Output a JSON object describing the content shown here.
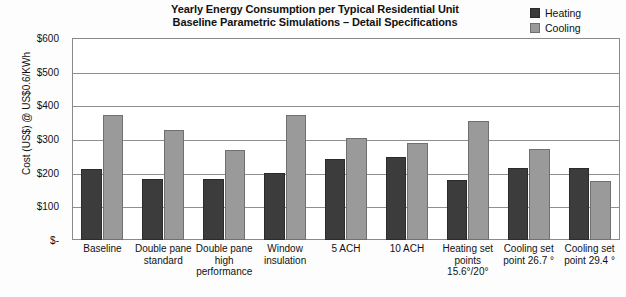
{
  "chart_data": {
    "type": "bar",
    "title": "Yearly Energy Consumption per Typical Residential Unit",
    "subtitle": "Baseline Parametric Simulations – Detail Specifications",
    "xlabel": "",
    "ylabel": "Cost (US$) @ US$0.6/KWh",
    "ylim": [
      0,
      600
    ],
    "ytick_values": [
      600,
      500,
      400,
      300,
      200,
      100,
      0
    ],
    "ytick_labels": [
      "$600",
      "$500",
      "$400",
      "$300",
      "$200",
      "$100",
      "$-"
    ],
    "grid": true,
    "legend_position": "top-right",
    "categories": [
      "Baseline",
      "Double pane standard",
      "Double pane high performance",
      "Window insulation",
      "5 ACH",
      "10 ACH",
      "Heating set points 15.6°/20°",
      "Cooling set point 26.7 °",
      "Cooling set point 29.4 °"
    ],
    "series": [
      {
        "name": "Heating",
        "color": "#3c3c3c",
        "values": [
          211,
          180,
          180,
          199,
          241,
          248,
          178,
          215,
          215
        ]
      },
      {
        "name": "Cooling",
        "color": "#9a9a9a",
        "values": [
          372,
          327,
          268,
          372,
          303,
          289,
          353,
          270,
          175
        ]
      }
    ]
  },
  "legend": {
    "items": [
      {
        "label": "Heating",
        "swatch": "heating-swatch"
      },
      {
        "label": "Cooling",
        "swatch": "cooling-swatch"
      }
    ]
  },
  "xtick_lines": [
    [
      "Baseline"
    ],
    [
      "Double pane",
      "standard"
    ],
    [
      "Double pane",
      "high",
      "performance"
    ],
    [
      "Window",
      "insulation"
    ],
    [
      "5 ACH"
    ],
    [
      "10 ACH"
    ],
    [
      "Heating set",
      "points",
      "15.6°/20°"
    ],
    [
      "Cooling set",
      "point 26.7 °"
    ],
    [
      "Cooling set",
      "point 29.4 °"
    ]
  ]
}
